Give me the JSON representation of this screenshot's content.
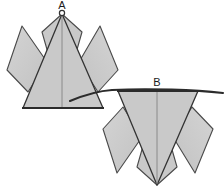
{
  "figure": {
    "background_color": "#ffffff",
    "paper_fill": "#c9c9c9",
    "paper_fill_light": "#d2d2d2",
    "paper_fill_dark": "#bfbfbf",
    "line_color": "#3a3a3a",
    "crease_color": "#555555",
    "outline_color": "#2b2b2b"
  },
  "labels": {
    "a": "A",
    "b": "B"
  },
  "marks": {
    "vertex_marker_a": "circle-marker",
    "fold_arrow": "curved-fold-arrow"
  },
  "steps": [
    {
      "id": "A",
      "label": "A",
      "description": "Upward pointing folded paper model with central triangle, two inner spikes and two outer flaps",
      "orientation": "point-up"
    },
    {
      "id": "B",
      "label": "B",
      "description": "Downward pointing folded paper model, inverted version of step A with flat top edge",
      "orientation": "point-down"
    }
  ]
}
